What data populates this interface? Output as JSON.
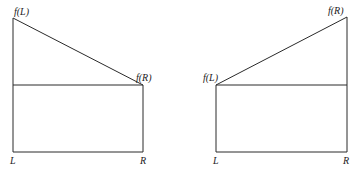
{
  "left_figure": {
    "top_left_label": "f(L)",
    "corner_label": "f(R)",
    "x_left_label": "L",
    "x_right_label": "R",
    "description": "Rectangle under f(R) with triangle on top rising to f(L) at left"
  },
  "right_figure": {
    "corner_label": "f(L)",
    "top_right_label": "f(R)",
    "x_left_label": "L",
    "x_right_label": "R",
    "description": "Rectangle under f(L) with triangle on top rising to f(R) at right"
  },
  "colors": {
    "line": "#2a2a2a",
    "text": "#222222",
    "background": "#ffffff"
  }
}
